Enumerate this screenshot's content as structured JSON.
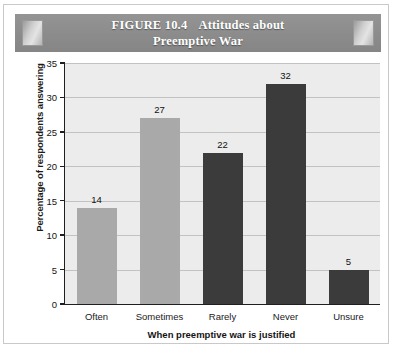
{
  "figure": {
    "header": {
      "figure_number": "FIGURE 10.4",
      "title_line1": "Attitudes about",
      "title_line2": "Preemptive War",
      "band_color": "#8d8d8d",
      "text_color": "#ffffff"
    }
  },
  "chart_data": {
    "type": "bar",
    "categories": [
      "Often",
      "Sometimes",
      "Rarely",
      "Never",
      "Unsure"
    ],
    "values": [
      14,
      27,
      22,
      32,
      5
    ],
    "value_labels": [
      "14",
      "27",
      "22",
      "32",
      "5"
    ],
    "bar_colors": [
      "#a9a9a9",
      "#a9a9a9",
      "#3b3b3b",
      "#3b3b3b",
      "#3b3b3b"
    ],
    "xlabel": "When preemptive war is justified",
    "ylabel": "Percentage of respondents answering",
    "ylim": [
      0,
      35
    ],
    "yticks": [
      0,
      5,
      10,
      15,
      20,
      25,
      30,
      35
    ],
    "ytick_labels": [
      "0",
      "5",
      "10",
      "15",
      "20",
      "25",
      "30",
      "35"
    ],
    "grid": "horizontal",
    "legend": "none",
    "plot_background": "#ececec"
  }
}
